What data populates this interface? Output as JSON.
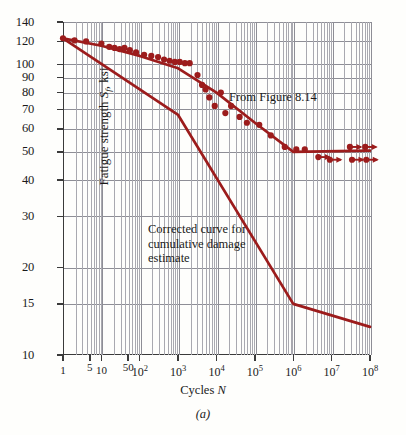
{
  "figure": {
    "caption": "(a)",
    "ylabel_prefix": "Fatigue strength ",
    "ylabel_sym": "S",
    "ylabel_sub": "f",
    "ylabel_suffix": ", ksi",
    "xlabel_prefix": "Cycles ",
    "xlabel_sym": "N"
  },
  "annotations": {
    "upper_curve": "From Figure 8.14",
    "lower_curve_line1": "Corrected curve for",
    "lower_curve_line2": "cumulative damage",
    "lower_curve_line3": "estimate"
  },
  "chart_data": {
    "type": "line",
    "title": "",
    "subtitle": "",
    "xlabel": "Cycles N",
    "ylabel": "Fatigue strength S_f, ksi",
    "xscale": "log",
    "yscale": "log",
    "xlim": [
      1,
      100000000
    ],
    "ylim": [
      10,
      140
    ],
    "grid": true,
    "legend": "none",
    "accent_color": "#9c1c1c",
    "grid_color": "#8e8e96",
    "axis_color": "#3a3a3a",
    "ytick_labels": [
      "140",
      "120",
      "100",
      "90",
      "80",
      "70",
      "60",
      "50",
      "40",
      "30",
      "20",
      "15",
      "10"
    ],
    "ytick_values": [
      140,
      120,
      100,
      90,
      80,
      70,
      60,
      50,
      40,
      30,
      20,
      15,
      10
    ],
    "xtick_labels": [
      "1",
      "5",
      "10",
      "50",
      "10²",
      "10³",
      "10⁴",
      "10⁵",
      "10⁶",
      "10⁷",
      "10⁸"
    ],
    "xtick_values": [
      1,
      5,
      10,
      50,
      100,
      1000,
      10000,
      100000,
      1000000,
      10000000,
      100000000
    ],
    "series": [
      {
        "name": "From Figure 8.14",
        "type": "line",
        "color": "#9c1c1c",
        "points": [
          [
            1,
            123
          ],
          [
            10,
            116
          ],
          [
            100,
            107
          ],
          [
            1000,
            97
          ],
          [
            10000,
            80
          ],
          [
            100000,
            63
          ],
          [
            1000000,
            50
          ],
          [
            100000000,
            50.5
          ]
        ]
      },
      {
        "name": "Corrected curve for cumulative damage estimate",
        "type": "line",
        "color": "#9c1c1c",
        "points": [
          [
            1,
            123
          ],
          [
            1000,
            67
          ],
          [
            1000000,
            15
          ],
          [
            100000000,
            12.5
          ]
        ]
      },
      {
        "name": "Test data",
        "type": "scatter",
        "color": "#9c1c1c",
        "points": [
          [
            1,
            123
          ],
          [
            2,
            121
          ],
          [
            4,
            120
          ],
          [
            10,
            118
          ],
          [
            16,
            115
          ],
          [
            22,
            114
          ],
          [
            30,
            113
          ],
          [
            40,
            114
          ],
          [
            55,
            112
          ],
          [
            80,
            110
          ],
          [
            130,
            108
          ],
          [
            200,
            107
          ],
          [
            300,
            106
          ],
          [
            430,
            104
          ],
          [
            600,
            103
          ],
          [
            820,
            102
          ],
          [
            1100,
            102
          ],
          [
            1500,
            101
          ],
          [
            2000,
            101
          ],
          [
            3200,
            92
          ],
          [
            4200,
            85
          ],
          [
            5200,
            82
          ],
          [
            6500,
            77
          ],
          [
            9000,
            72
          ],
          [
            13000,
            80
          ],
          [
            17000,
            68
          ],
          [
            24000,
            72
          ],
          [
            40000,
            66
          ],
          [
            62000,
            63
          ],
          [
            130000,
            62
          ],
          [
            260000,
            57
          ],
          [
            600000,
            52
          ],
          [
            1200000,
            51
          ],
          [
            2000000,
            51
          ]
        ]
      },
      {
        "name": "Runout data",
        "type": "scatter-arrow",
        "color": "#9c1c1c",
        "points": [
          [
            4500000,
            48
          ],
          [
            9000000,
            47
          ],
          [
            30000000,
            52
          ],
          [
            34000000,
            47
          ],
          [
            75000000,
            52
          ],
          [
            80000000,
            47
          ]
        ]
      }
    ]
  }
}
